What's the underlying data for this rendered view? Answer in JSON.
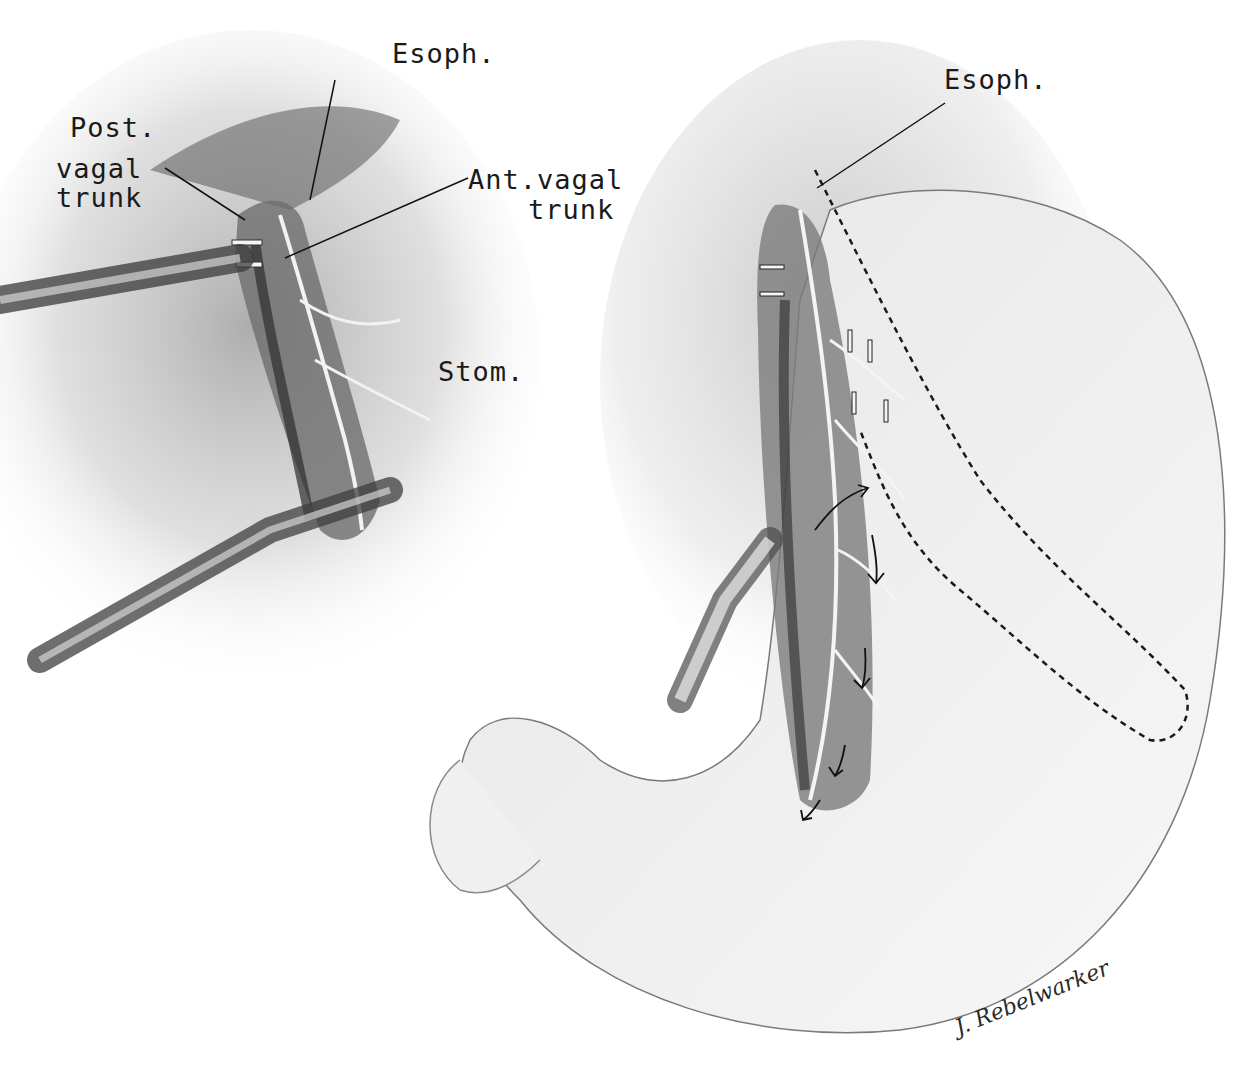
{
  "figure": {
    "left_panel": {
      "labels": {
        "esoph": "Esoph.",
        "post_vagal_1": "Post.",
        "post_vagal_2": "vagal",
        "post_vagal_3": "trunk",
        "ant_vagal_1": "Ant.vagal",
        "ant_vagal_2": "trunk",
        "stom": "Stom."
      }
    },
    "right_panel": {
      "labels": {
        "esoph": "Esoph."
      }
    },
    "signature": "J. Rebelwarker"
  },
  "colors": {
    "background": "#ffffff",
    "ink": "#1a1a1a",
    "shade_dark": "#4a4a4a",
    "shade_mid": "#9a9a9a",
    "shade_light": "#dcdcdc"
  }
}
